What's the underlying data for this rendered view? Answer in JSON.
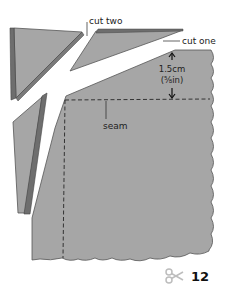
{
  "labels": {
    "cut_two": "cut two",
    "cut_one": "cut one",
    "measure_metric": "1.5cm",
    "measure_imperial": "(⅝in)",
    "seam": "seam"
  },
  "footer": {
    "icon": "scissors-icon",
    "page_number": "12"
  },
  "colors": {
    "fabric": "#a6a6a6",
    "fabric_edge": "#555555",
    "fold_dark": "#6e6e6e",
    "seam_line": "#333333",
    "scissors": "#bdbdbd"
  }
}
